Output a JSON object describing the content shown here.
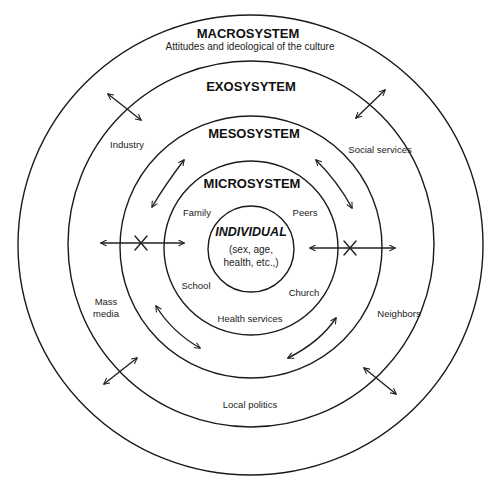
{
  "diagram": {
    "type": "concentric-systems",
    "rings": [
      {
        "name": "macrosystem",
        "title": "MACROSYSTEM",
        "subtitle": "Attitudes and ideological of the culture"
      },
      {
        "name": "exosystem",
        "title": "EXOSYSYTEM"
      },
      {
        "name": "mesosystem",
        "title": "MESOSYSTEM"
      },
      {
        "name": "microsystem",
        "title": "MICROSYSTEM"
      },
      {
        "name": "individual",
        "title": "INDIVIDUAL",
        "detail_line1": "(sex, age,",
        "detail_line2": "health, etc.,)"
      }
    ],
    "exosystem_items": {
      "industry": "Industry",
      "social_services": "Social services",
      "mass_media_line1": "Mass",
      "mass_media_line2": "media",
      "neighbors": "Neighbors",
      "local_politics": "Local politics"
    },
    "microsystem_items": {
      "family": "Family",
      "peers": "Peers",
      "school": "School",
      "church": "Church",
      "health_services": "Health services"
    },
    "colors": {
      "line": "#1a1a1a",
      "background": "#ffffff"
    }
  }
}
